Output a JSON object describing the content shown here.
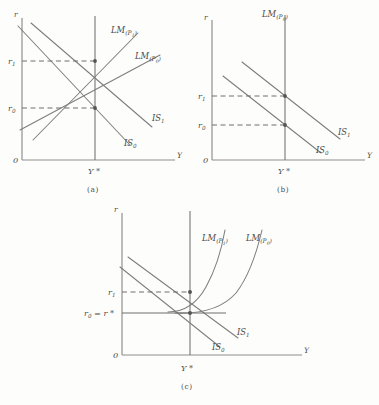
{
  "figure": {
    "background_color": "#fdfdfb",
    "ink_color": "#7d7d7d",
    "text_color": "#4a4a4a"
  },
  "panels": [
    {
      "id": "a",
      "caption": "(a)",
      "description": "Upward-sloping LM curves; both IS and LM shift so equilibrium output stays at Y*",
      "axis": {
        "y_label": "r",
        "x_label": "Y",
        "origin_label": "0"
      },
      "ticks": {
        "upper": "r",
        "upper_sub": "1",
        "lower": "r",
        "lower_sub": "0",
        "x_star": "Y *"
      },
      "curves": [
        {
          "name": "LM_P1",
          "label_main": "LM",
          "label_sub": "(P",
          "label_sub_num": "1",
          "label_close": ")",
          "shape": "upward-line"
        },
        {
          "name": "LM_P0",
          "label_main": "LM",
          "label_sub": "(P",
          "label_sub_num": "0",
          "label_close": ")",
          "shape": "upward-line"
        },
        {
          "name": "IS_1",
          "label_main": "IS",
          "label_sub_num": "1",
          "shape": "downward-line"
        },
        {
          "name": "IS_0",
          "label_main": "IS",
          "label_sub_num": "0",
          "shape": "downward-line"
        }
      ],
      "equilibria": [
        {
          "name": "upper-equilibrium",
          "rate": "r1",
          "output": "Y*"
        },
        {
          "name": "lower-equilibrium",
          "rate": "r0",
          "output": "Y*"
        }
      ]
    },
    {
      "id": "b",
      "caption": "(b)",
      "description": "Vertical (classical) LM curve; IS shift raises the interest rate only, output fixed at Y*",
      "axis": {
        "y_label": "r",
        "x_label": "Y",
        "origin_label": "0"
      },
      "ticks": {
        "upper": "r",
        "upper_sub": "1",
        "lower": "r",
        "lower_sub": "0",
        "x_star": "Y *"
      },
      "curves": [
        {
          "name": "LM_P0",
          "label_main": "LM",
          "label_sub": "(P",
          "label_sub_num": "0",
          "label_close": ")",
          "shape": "vertical-line"
        },
        {
          "name": "IS_1",
          "label_main": "IS",
          "label_sub_num": "1",
          "shape": "downward-line"
        },
        {
          "name": "IS_0",
          "label_main": "IS",
          "label_sub_num": "0",
          "shape": "downward-line"
        }
      ],
      "equilibria": [
        {
          "name": "upper-equilibrium",
          "rate": "r1",
          "output": "Y*"
        },
        {
          "name": "lower-equilibrium",
          "rate": "r0",
          "output": "Y*"
        }
      ]
    },
    {
      "id": "c",
      "caption": "(c)",
      "description": "J-shaped LM curves with a liquidity-trap floor; r0 equals the floor rate r*",
      "axis": {
        "y_label": "r",
        "x_label": "Y",
        "origin_label": "0"
      },
      "ticks": {
        "upper": "r",
        "upper_sub": "1",
        "lower_compound": "r",
        "lower_sub": "0",
        "lower_eq": " = r *",
        "x_star": "Y *"
      },
      "curves": [
        {
          "name": "LM_P1",
          "label_main": "LM",
          "label_sub": "(P",
          "label_sub_num": "1",
          "label_close": ")",
          "shape": "j-curve"
        },
        {
          "name": "LM_P0",
          "label_main": "LM",
          "label_sub": "(P",
          "label_sub_num": "0",
          "label_close": ")",
          "shape": "j-curve"
        },
        {
          "name": "IS_1",
          "label_main": "IS",
          "label_sub_num": "1",
          "shape": "downward-line"
        },
        {
          "name": "IS_0",
          "label_main": "IS",
          "label_sub_num": "0",
          "shape": "downward-line"
        }
      ],
      "equilibria": [
        {
          "name": "upper-equilibrium",
          "rate": "r1",
          "output": "Y*"
        },
        {
          "name": "trap-equilibrium",
          "rate": "r0 = r*",
          "output": "Y*"
        }
      ]
    }
  ]
}
